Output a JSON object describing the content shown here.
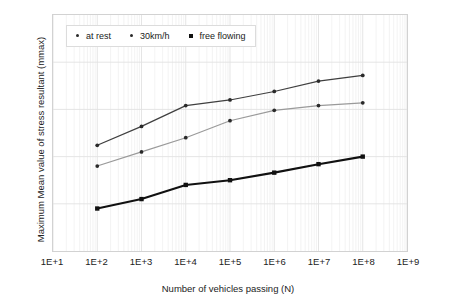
{
  "chart_data": {
    "type": "line",
    "title": "",
    "xlabel": "Number of vehicles passing (N)",
    "ylabel": "Maximum Mean value of stress resultant (mmax)",
    "x_scale": "log",
    "x_tick_labels": [
      "1E+1",
      "1E+2",
      "1E+3",
      "1E+4",
      "1E+5",
      "1E+6",
      "1E+7",
      "1E+8",
      "1E+9"
    ],
    "x_tick_exponents": [
      1,
      2,
      3,
      4,
      5,
      6,
      7,
      8,
      9
    ],
    "xlim": [
      1,
      9
    ],
    "y_tick_labels": [
      "0",
      "5",
      "10",
      "15",
      "25"
    ],
    "y_tick_values": [
      0,
      5,
      10,
      15,
      25
    ],
    "ylim": [
      0,
      25
    ],
    "grid": true,
    "legend_position": "top-left",
    "x": [
      2,
      3,
      4,
      5,
      6,
      7,
      8
    ],
    "series": [
      {
        "name": "at rest",
        "color": "#3f3f3f",
        "marker": "dot",
        "values": [
          11.2,
          13.2,
          15.4,
          16.0,
          16.9,
          18.0,
          18.6
        ]
      },
      {
        "name": "30km/h",
        "color": "#9a9a9a",
        "marker": "dot",
        "values": [
          9.0,
          10.5,
          12.0,
          13.8,
          14.9,
          15.4,
          15.7
        ]
      },
      {
        "name": "free flowing",
        "color": "#111111",
        "marker": "square",
        "values": [
          4.5,
          5.5,
          7.0,
          7.5,
          8.3,
          9.2,
          10.0
        ]
      }
    ]
  }
}
